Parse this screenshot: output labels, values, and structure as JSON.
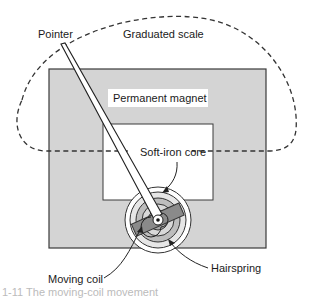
{
  "diagram": {
    "labels": {
      "pointer": "Pointer",
      "graduated_scale": "Graduated scale",
      "permanent_magnet": "Permanent magnet",
      "soft_iron_core": "Soft-iron core",
      "moving_coil": "Moving coil",
      "hairspring": "Hairspring"
    },
    "caption": "1-11  The moving-coil movement",
    "colors": {
      "magnet_fill": "#d4d4d4",
      "coil_fill": "#8a8a8a",
      "outline": "#3a3a3a",
      "dashes": "#333333",
      "background": "#ffffff"
    }
  }
}
